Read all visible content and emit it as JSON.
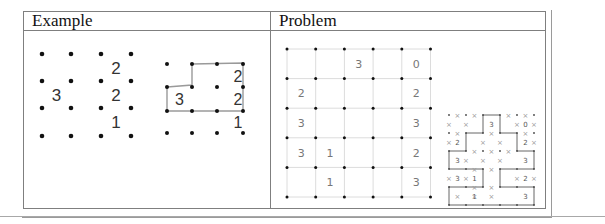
{
  "table": {
    "headers": [
      "Example",
      "Problem"
    ]
  },
  "example": {
    "unsolved": {
      "dot_cols": 4,
      "dot_rows": 4,
      "clues": [
        {
          "row": 0,
          "col": 2,
          "value": "2"
        },
        {
          "row": 1,
          "col": 0,
          "value": "3"
        },
        {
          "row": 1,
          "col": 2,
          "value": "2"
        },
        {
          "row": 2,
          "col": 2,
          "value": "1"
        }
      ]
    },
    "solved": {
      "dot_cols": 4,
      "dot_rows": 4,
      "clues": [
        {
          "row": 0,
          "col": 2,
          "value": "2"
        },
        {
          "row": 1,
          "col": 0,
          "value": "3"
        },
        {
          "row": 1,
          "col": 2,
          "value": "2"
        },
        {
          "row": 2,
          "col": 2,
          "value": "1"
        }
      ]
    }
  },
  "problem": {
    "grid_size": 5,
    "clues": [
      [
        "",
        "",
        "3",
        "",
        "0"
      ],
      [
        "2",
        "",
        "",
        "",
        "2"
      ],
      [
        "3",
        "",
        "",
        "",
        "3"
      ],
      [
        "3",
        "1",
        "",
        "",
        "2"
      ],
      [
        "",
        "1",
        "",
        "",
        "3"
      ]
    ],
    "solution_thumbnail": {
      "clues": [
        [
          "",
          "",
          "3",
          "",
          "0"
        ],
        [
          "2",
          "",
          "",
          "",
          "2"
        ],
        [
          "3",
          "",
          "",
          "",
          "3"
        ],
        [
          "3",
          "1",
          "",
          "",
          "2"
        ],
        [
          "",
          "1",
          "",
          "",
          "3"
        ]
      ]
    }
  },
  "colors": {
    "border": "#7f7f7f",
    "dot": "#111111",
    "clue_dark": "#333333",
    "grid_line_light": "#dcdcdc",
    "clue_light": "#777777",
    "loop_line": "#9a9a9a"
  }
}
